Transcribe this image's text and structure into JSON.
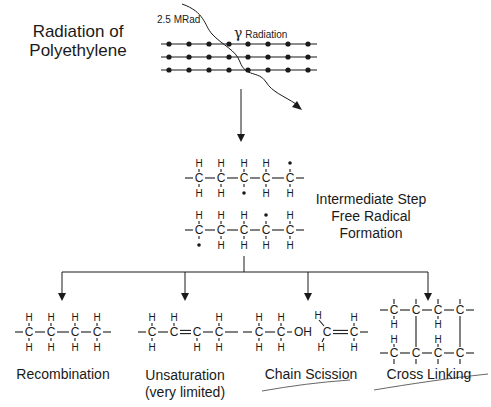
{
  "title": {
    "line1": "Radiation of",
    "line2": "Polyethylene"
  },
  "dose_label": "2.5 MRad",
  "radiation_label": {
    "symbol": "γ",
    "text": "Radiation"
  },
  "intermediate": {
    "line1": "Intermediate Step",
    "line2": "Free Radical",
    "line3": "Formation"
  },
  "outcomes": [
    {
      "id": "recombination",
      "line1": "Recombination",
      "line2": ""
    },
    {
      "id": "unsaturation",
      "line1": "Unsaturation",
      "line2": "(very limited)"
    },
    {
      "id": "chain-scission",
      "line1": "Chain Scission",
      "line2": ""
    },
    {
      "id": "cross-linking",
      "line1": "Cross Linking",
      "line2": ""
    }
  ],
  "atoms": {
    "carbon": "C",
    "hydrogen": "H",
    "hydroxyl": "OH"
  },
  "colors": {
    "ink": "#1a1a1a",
    "background": "#ffffff"
  }
}
